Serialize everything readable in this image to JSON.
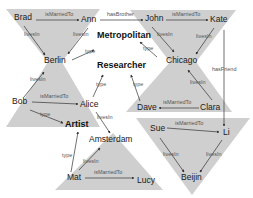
{
  "diagram": {
    "colors": {
      "region": "#cfcfcf",
      "edge": "#333333",
      "text": "#1a1a1a",
      "label": "#555555"
    },
    "regions": [
      {
        "id": "berlin-hourglass",
        "points": "6,9 100,9 62,62 100,127 6,127 48,62"
      },
      {
        "id": "chicago-hourglass",
        "points": "130,10 236,10 196,62 232,112 126,112 170,62"
      },
      {
        "id": "beijin-triangle",
        "points": "136,118 250,118 192,195"
      },
      {
        "id": "amsterdam-triangle",
        "points": "113,133 163,190 55,190"
      }
    ],
    "nodes": [
      {
        "id": "brad",
        "label": "Brad",
        "x": 14,
        "y": 20,
        "class": false
      },
      {
        "id": "ann",
        "label": "Ann",
        "x": 81,
        "y": 22,
        "class": false
      },
      {
        "id": "john",
        "label": "John",
        "x": 145,
        "y": 21,
        "class": false
      },
      {
        "id": "kate",
        "label": "Kate",
        "x": 210,
        "y": 22,
        "class": false
      },
      {
        "id": "berlin",
        "label": "Berlin",
        "x": 44,
        "y": 63,
        "class": false
      },
      {
        "id": "chicago",
        "label": "Chicago",
        "x": 166,
        "y": 63,
        "class": false
      },
      {
        "id": "metropolitan",
        "label": "Metropolitan",
        "x": 97,
        "y": 38,
        "class": true
      },
      {
        "id": "researcher",
        "label": "Researcher",
        "x": 97,
        "y": 68,
        "class": true
      },
      {
        "id": "bob",
        "label": "Bob",
        "x": 12,
        "y": 104,
        "class": false
      },
      {
        "id": "alice",
        "label": "Alice",
        "x": 80,
        "y": 107,
        "class": false
      },
      {
        "id": "dave",
        "label": "Dave",
        "x": 137,
        "y": 110,
        "class": false
      },
      {
        "id": "clara",
        "label": "Clara",
        "x": 200,
        "y": 110,
        "class": false
      },
      {
        "id": "artist",
        "label": "Artist",
        "x": 65,
        "y": 127,
        "class": true
      },
      {
        "id": "amsterdam",
        "label": "Amsterdam",
        "x": 89,
        "y": 142,
        "class": false
      },
      {
        "id": "sue",
        "label": "Sue",
        "x": 150,
        "y": 131,
        "class": false
      },
      {
        "id": "li",
        "label": "Li",
        "x": 223,
        "y": 135,
        "class": false
      },
      {
        "id": "beijin",
        "label": "Beijin",
        "x": 181,
        "y": 180,
        "class": false
      },
      {
        "id": "mat",
        "label": "Mat",
        "x": 67,
        "y": 180,
        "class": false
      },
      {
        "id": "lucy",
        "label": "Lucy",
        "x": 137,
        "y": 183,
        "class": false
      }
    ],
    "edges": [
      {
        "from": "brad",
        "to": "ann",
        "label": "isMarriedTo",
        "x1": 36,
        "y1": 20,
        "x2": 79,
        "y2": 20,
        "lx": 45,
        "ly": 16
      },
      {
        "from": "ann",
        "to": "john",
        "label": "hasBrother",
        "x1": 100,
        "y1": 20,
        "x2": 143,
        "y2": 20,
        "lx": 107,
        "ly": 16
      },
      {
        "from": "john",
        "to": "kate",
        "label": "isMarriedTo",
        "x1": 166,
        "y1": 20,
        "x2": 208,
        "y2": 20,
        "lx": 172,
        "ly": 16
      },
      {
        "from": "brad",
        "to": "berlin",
        "label": "livesIn",
        "x1": 24,
        "y1": 26,
        "x2": 45,
        "y2": 55,
        "lx": 24,
        "ly": 36
      },
      {
        "from": "ann",
        "to": "berlin",
        "label": "livesIn",
        "x1": 88,
        "y1": 28,
        "x2": 68,
        "y2": 54,
        "lx": 73,
        "ly": 36
      },
      {
        "from": "berlin",
        "to": "metropolitan",
        "label": "type",
        "x1": 72,
        "y1": 60,
        "x2": 94,
        "y2": 50,
        "lx": 85,
        "ly": 53
      },
      {
        "from": "chicago",
        "to": "metropolitan",
        "label": "type",
        "x1": 157,
        "y1": 57,
        "x2": 140,
        "y2": 42,
        "lx": 143,
        "ly": 50
      },
      {
        "from": "john",
        "to": "chicago",
        "label": "livesIn",
        "x1": 152,
        "y1": 27,
        "x2": 174,
        "y2": 52,
        "lx": 157,
        "ly": 36
      },
      {
        "from": "kate",
        "to": "chicago",
        "label": "livesIn",
        "x1": 214,
        "y1": 28,
        "x2": 196,
        "y2": 54,
        "lx": 196,
        "ly": 38
      },
      {
        "from": "kate",
        "to": "li",
        "label": "hasFriend",
        "x1": 224,
        "y1": 30,
        "x2": 224,
        "y2": 126,
        "lx": 212,
        "ly": 71
      },
      {
        "from": "bob",
        "to": "berlin",
        "label": "livesIn",
        "x1": 24,
        "y1": 97,
        "x2": 44,
        "y2": 72,
        "lx": 30,
        "ly": 81
      },
      {
        "from": "bob",
        "to": "alice",
        "label": "isMarriedTo",
        "x1": 32,
        "y1": 102,
        "x2": 78,
        "y2": 104,
        "lx": 40,
        "ly": 98
      },
      {
        "from": "alice",
        "to": "researcher",
        "label": "type",
        "x1": 93,
        "y1": 97,
        "x2": 103,
        "y2": 75,
        "lx": 96,
        "ly": 86
      },
      {
        "from": "dave",
        "to": "researcher",
        "label": "type",
        "x1": 140,
        "y1": 101,
        "x2": 131,
        "y2": 75,
        "lx": 133,
        "ly": 86
      },
      {
        "from": "clara",
        "to": "chicago",
        "label": "livesIn",
        "x1": 212,
        "y1": 100,
        "x2": 188,
        "y2": 70,
        "lx": 190,
        "ly": 84
      },
      {
        "from": "clara",
        "to": "dave",
        "label": "isMarriedTo",
        "x1": 199,
        "y1": 108,
        "x2": 159,
        "y2": 108,
        "lx": 163,
        "ly": 104
      },
      {
        "from": "bob",
        "to": "artist",
        "label": "type",
        "x1": 30,
        "y1": 110,
        "x2": 63,
        "y2": 123,
        "lx": 40,
        "ly": 116
      },
      {
        "from": "alice",
        "to": "amsterdam",
        "label": "livesIn",
        "x1": 96,
        "y1": 112,
        "x2": 110,
        "y2": 133,
        "lx": 97,
        "ly": 119
      },
      {
        "from": "mat",
        "to": "artist",
        "label": "type",
        "x1": 71,
        "y1": 172,
        "x2": 78,
        "y2": 132,
        "lx": 62,
        "ly": 157
      },
      {
        "from": "mat",
        "to": "amsterdam",
        "label": "livesIn",
        "x1": 79,
        "y1": 170,
        "x2": 100,
        "y2": 148,
        "lx": 83,
        "ly": 163
      },
      {
        "from": "mat",
        "to": "lucy",
        "label": "isMarriedTo",
        "x1": 85,
        "y1": 178,
        "x2": 134,
        "y2": 178,
        "lx": 94,
        "ly": 174
      },
      {
        "from": "sue",
        "to": "li",
        "label": "isMarriedTo",
        "x1": 167,
        "y1": 128,
        "x2": 219,
        "y2": 132,
        "lx": 175,
        "ly": 125
      },
      {
        "from": "sue",
        "to": "beijin",
        "label": "livesIn",
        "x1": 160,
        "y1": 138,
        "x2": 184,
        "y2": 172,
        "lx": 163,
        "ly": 156
      },
      {
        "from": "li",
        "to": "beijin",
        "label": "livesIn",
        "x1": 222,
        "y1": 140,
        "x2": 200,
        "y2": 172,
        "lx": 206,
        "ly": 156
      }
    ]
  }
}
